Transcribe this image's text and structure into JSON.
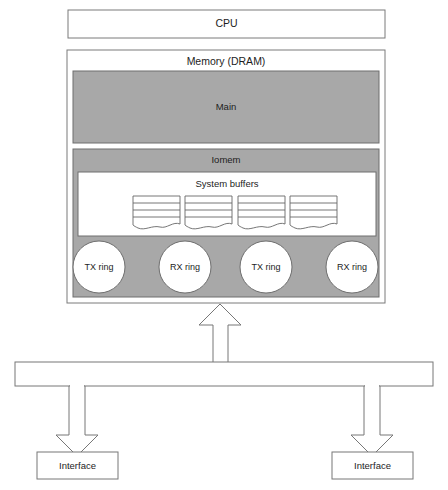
{
  "diagram": {
    "title_blocks": {
      "cpu": "CPU",
      "memory": "Memory (DRAM)",
      "main": "Main",
      "iomem": "Iomem",
      "system_buffers": "System buffers"
    },
    "rings": [
      {
        "label": "TX ring"
      },
      {
        "label": "RX ring"
      },
      {
        "label": "TX ring"
      },
      {
        "label": "RX ring"
      }
    ],
    "buffers": [
      {
        "name": "buffer-1",
        "lines": 3
      },
      {
        "name": "buffer-2",
        "lines": 3
      },
      {
        "name": "buffer-3",
        "lines": 3
      },
      {
        "name": "buffer-4",
        "lines": 3
      }
    ],
    "interfaces": [
      {
        "label": "Interface"
      },
      {
        "label": "Interface"
      }
    ],
    "bus": {
      "label": ""
    },
    "colors": {
      "page_background": "#ffffff",
      "memory_fill": "#ffffff",
      "gray_fill": "#a8a8a8",
      "stroke": "#6e6e6e",
      "dark_stroke": "#555555",
      "text": "#1d1d1d",
      "buffer_fill": "#ffffff",
      "ring_fill": "#ffffff",
      "arrow_fill": "#ffffff"
    }
  }
}
